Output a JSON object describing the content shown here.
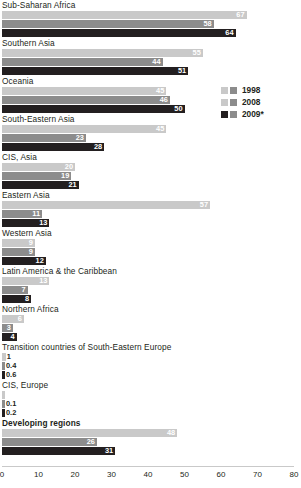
{
  "chart_data": {
    "type": "bar",
    "orientation": "horizontal",
    "title": "",
    "xlabel": "",
    "ylabel": "",
    "xlim": [
      0,
      80
    ],
    "xticks": [
      "0",
      "10",
      "20",
      "30",
      "40",
      "50",
      "60",
      "70",
      "80"
    ],
    "grid": false,
    "legend_position": "right-upper",
    "series": [
      {
        "name": "1998",
        "color": "#c9c9c9",
        "values": [
          67,
          55,
          45,
          45,
          20,
          57,
          9,
          13,
          6,
          1,
          0.4,
          48
        ]
      },
      {
        "name": "2008",
        "color": "#8c8c8c",
        "values": [
          58,
          44,
          46,
          23,
          19,
          11,
          9,
          7,
          3,
          0.4,
          0.1,
          26
        ]
      },
      {
        "name": "2009*",
        "color": "#231f20",
        "values": [
          64,
          51,
          50,
          28,
          21,
          13,
          12,
          8,
          4,
          0.6,
          0.2,
          31
        ]
      }
    ],
    "categories": [
      "Sub-Saharan Africa",
      "Southern Asia",
      "Oceania",
      "South-Eastern Asia",
      "CIS, Asia",
      "Eastern Asia",
      "Western Asia",
      "Latin America & the Caribbean",
      "Northern Africa",
      "Transition countries of South-Eastern  Europe",
      "CIS, Europe",
      "Developing regions"
    ],
    "data_labels": [
      {
        "category": "Sub-Saharan Africa",
        "bold": false,
        "labels": [
          "67",
          "58",
          "64"
        ]
      },
      {
        "category": "Southern Asia",
        "bold": false,
        "labels": [
          "55",
          "44",
          "51"
        ]
      },
      {
        "category": "Oceania",
        "bold": false,
        "labels": [
          "45",
          "46",
          "50"
        ]
      },
      {
        "category": "South-Eastern Asia",
        "bold": false,
        "labels": [
          "45",
          "23",
          "28"
        ]
      },
      {
        "category": "CIS, Asia",
        "bold": false,
        "labels": [
          "20",
          "19",
          "21"
        ]
      },
      {
        "category": "Eastern Asia",
        "bold": false,
        "labels": [
          "57",
          "11",
          "13"
        ]
      },
      {
        "category": "Western Asia",
        "bold": false,
        "labels": [
          "9",
          "9",
          "12"
        ]
      },
      {
        "category": "Latin America & the Caribbean",
        "bold": false,
        "labels": [
          "13",
          "7",
          "8"
        ]
      },
      {
        "category": "Northern Africa",
        "bold": false,
        "labels": [
          "6",
          "3",
          "4"
        ]
      },
      {
        "category": "Transition countries of South-Eastern  Europe",
        "bold": false,
        "labels": [
          "1",
          "0.4",
          "0.6"
        ]
      },
      {
        "category": "CIS, Europe",
        "bold": false,
        "labels": [
          "",
          "0.1",
          "0.2"
        ]
      },
      {
        "category": "Developing regions",
        "bold": true,
        "labels": [
          "48",
          "26",
          "31"
        ]
      }
    ]
  },
  "legend": {
    "items": [
      {
        "label": "1998"
      },
      {
        "label": "2008"
      },
      {
        "label": "2009*"
      }
    ]
  }
}
